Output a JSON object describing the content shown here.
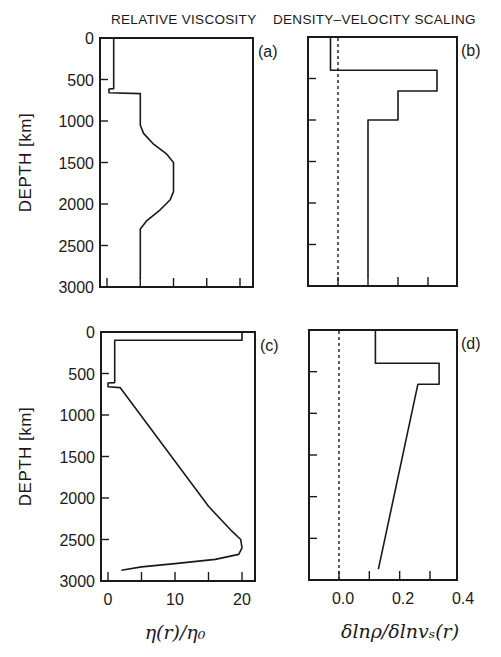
{
  "figure": {
    "column_titles": [
      "RELATIVE VISCOSITY",
      "DENSITY–VELOCITY SCALING"
    ],
    "y_axis_label": "DEPTH [km]",
    "x_axis_labels": [
      "η(r)/η₀",
      "δlnρ/δlnvₛ(r)"
    ],
    "colors": {
      "line": "#1a1a1a",
      "background": "#ffffff"
    }
  },
  "chart_data": [
    {
      "panel": "(a)",
      "type": "line",
      "title": "RELATIVE VISCOSITY",
      "xlabel": "η(r)/η₀",
      "ylabel": "DEPTH [km]",
      "xlim": [
        -0.5,
        22
      ],
      "ylim": [
        3000,
        0
      ],
      "xticks": [
        0,
        5,
        10,
        15,
        20
      ],
      "xticklabels": [
        "0",
        "10",
        "20"
      ],
      "yticks": [
        0,
        500,
        1000,
        1500,
        2000,
        2500,
        3000
      ],
      "grid": false,
      "series": [
        {
          "name": "viscosity",
          "points": [
            [
              1,
              0
            ],
            [
              1,
              610
            ],
            [
              0.3,
              615
            ],
            [
              0.3,
              660
            ],
            [
              5,
              670
            ],
            [
              5,
              1050
            ],
            [
              5.5,
              1150
            ],
            [
              7,
              1280
            ],
            [
              9,
              1400
            ],
            [
              10,
              1500
            ],
            [
              10,
              1850
            ],
            [
              9.5,
              1950
            ],
            [
              8,
              2070
            ],
            [
              6,
              2200
            ],
            [
              5,
              2300
            ],
            [
              5,
              2900
            ]
          ]
        }
      ]
    },
    {
      "panel": "(b)",
      "type": "line",
      "title": "DENSITY–VELOCITY SCALING",
      "xlabel": "δlnρ/δlnvₛ(r)",
      "ylabel": "DEPTH [km]",
      "xlim": [
        -0.1,
        0.4
      ],
      "ylim": [
        3000,
        0
      ],
      "xticks": [
        0.0,
        0.1,
        0.2,
        0.3
      ],
      "xticklabels": [
        "0.0",
        "0.2",
        "0.4"
      ],
      "reference_line": {
        "x": 0.0,
        "style": "dashed"
      },
      "grid": false,
      "series": [
        {
          "name": "scaling",
          "points": [
            [
              -0.025,
              0
            ],
            [
              -0.025,
              400
            ],
            [
              0.33,
              400
            ],
            [
              0.33,
              650
            ],
            [
              0.2,
              650
            ],
            [
              0.2,
              1000
            ],
            [
              0.1,
              1000
            ],
            [
              0.1,
              2900
            ]
          ]
        }
      ]
    },
    {
      "panel": "(c)",
      "type": "line",
      "xlabel": "η(r)/η₀",
      "ylabel": "DEPTH [km]",
      "xlim": [
        -0.5,
        22
      ],
      "ylim": [
        3000,
        0
      ],
      "xticks": [
        0,
        5,
        10,
        15,
        20
      ],
      "xticklabels": [
        "0",
        "10",
        "20"
      ],
      "yticks": [
        0,
        500,
        1000,
        1500,
        2000,
        2500,
        3000
      ],
      "grid": false,
      "series": [
        {
          "name": "viscosity",
          "points": [
            [
              20,
              0
            ],
            [
              20,
              100
            ],
            [
              1,
              100
            ],
            [
              1,
              610
            ],
            [
              0,
              615
            ],
            [
              0,
              660
            ],
            [
              1.8,
              670
            ],
            [
              15,
              2100
            ],
            [
              18.5,
              2400
            ],
            [
              19.8,
              2500
            ],
            [
              20,
              2600
            ],
            [
              19.5,
              2680
            ],
            [
              16,
              2740
            ],
            [
              10,
              2790
            ],
            [
              5,
              2830
            ],
            [
              2,
              2870
            ]
          ]
        }
      ]
    },
    {
      "panel": "(d)",
      "type": "line",
      "xlabel": "δlnρ/δlnvₛ(r)",
      "xlim": [
        -0.1,
        0.4
      ],
      "ylim": [
        3000,
        0
      ],
      "xticks": [
        0.0,
        0.1,
        0.2,
        0.3
      ],
      "xticklabels": [
        "0.0",
        "0.2",
        "0.4"
      ],
      "reference_line": {
        "x": 0.0,
        "style": "dashed"
      },
      "grid": false,
      "series": [
        {
          "name": "scaling",
          "points": [
            [
              0.12,
              0
            ],
            [
              0.12,
              400
            ],
            [
              0.33,
              400
            ],
            [
              0.33,
              650
            ],
            [
              0.26,
              650
            ],
            [
              0.13,
              2870
            ]
          ]
        }
      ]
    }
  ]
}
